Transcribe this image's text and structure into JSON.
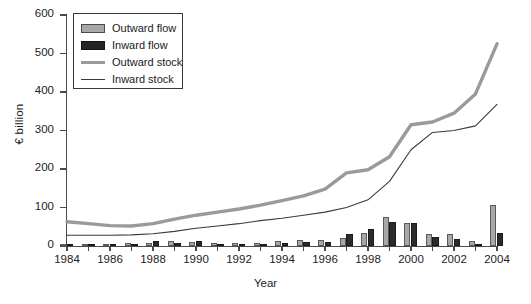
{
  "chart_data": {
    "type": "bar",
    "title": "",
    "xlabel": "Year",
    "ylabel": "€ billion",
    "xlim": [
      1984,
      2004
    ],
    "ylim": [
      0,
      600
    ],
    "yticks": [
      0,
      100,
      200,
      300,
      400,
      500,
      600
    ],
    "xticks": [
      1984,
      1986,
      1988,
      1990,
      1992,
      1994,
      1996,
      1998,
      2000,
      2002,
      2004
    ],
    "grid": false,
    "legend_position": "upper left",
    "categories": [
      1984,
      1985,
      1986,
      1987,
      1988,
      1989,
      1990,
      1991,
      1992,
      1993,
      1994,
      1995,
      1996,
      1997,
      1998,
      1999,
      2000,
      2001,
      2002,
      2003,
      2004
    ],
    "series": [
      {
        "name": "Outward flow",
        "type": "bar",
        "color": "#a8a8a8",
        "values": [
          3,
          2,
          4,
          7,
          9,
          13,
          10,
          8,
          8,
          9,
          12,
          15,
          16,
          21,
          33,
          75,
          59,
          32,
          31,
          12,
          107
        ]
      },
      {
        "name": "Inward flow",
        "type": "bar",
        "color": "#2b2b2b",
        "values": [
          2,
          1,
          3,
          5,
          12,
          9,
          14,
          5,
          5,
          6,
          8,
          10,
          11,
          30,
          43,
          63,
          59,
          24,
          18,
          2,
          33
        ]
      },
      {
        "name": "Outward stock",
        "type": "line",
        "color": "#9a9a9a",
        "values": [
          63,
          58,
          53,
          52,
          58,
          70,
          80,
          88,
          96,
          106,
          118,
          130,
          148,
          190,
          198,
          232,
          315,
          322,
          345,
          395,
          525
        ]
      },
      {
        "name": "Inward stock",
        "type": "line",
        "color": "#3a3a3a",
        "values": [
          28,
          28,
          28,
          29,
          32,
          38,
          46,
          52,
          58,
          66,
          72,
          80,
          88,
          100,
          120,
          168,
          250,
          295,
          300,
          312,
          368
        ]
      }
    ]
  },
  "legend": {
    "items": [
      {
        "label": "Outward flow",
        "key": "swatch-grey"
      },
      {
        "label": "Inward flow",
        "key": "swatch-black"
      },
      {
        "label": "Outward stock",
        "key": "line-thick-grey"
      },
      {
        "label": "Inward stock",
        "key": "line-thin-dark"
      }
    ]
  },
  "axes": {
    "y_title": "€ billion",
    "x_title": "Year",
    "y_tick_labels": [
      "0",
      "100",
      "200",
      "300",
      "400",
      "500",
      "600"
    ],
    "x_tick_labels": [
      "1984",
      "1986",
      "1988",
      "1990",
      "1992",
      "1994",
      "1996",
      "1998",
      "2000",
      "2002",
      "2004"
    ]
  }
}
